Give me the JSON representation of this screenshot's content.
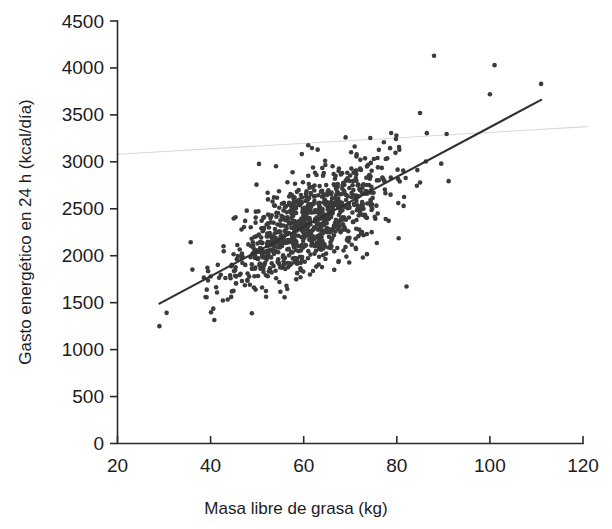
{
  "chart_data": {
    "type": "scatter",
    "title": "",
    "xlabel": "Masa libre de grasa (kg)",
    "ylabel": "Gasto energético en 24 h (kcal/día)",
    "xlim": [
      20,
      120
    ],
    "ylim": [
      0,
      4500
    ],
    "xticks": [
      20,
      40,
      60,
      80,
      100,
      120
    ],
    "yticks": [
      0,
      500,
      1000,
      1500,
      2000,
      2500,
      3000,
      3500,
      4000,
      4500
    ],
    "xtick_labels": [
      "20",
      "40",
      "60",
      "80",
      "100",
      "120"
    ],
    "ytick_labels": [
      "0",
      "500",
      "1000",
      "1500",
      "2000",
      "2500",
      "3000",
      "3500",
      "4000",
      "4500"
    ],
    "grid": false,
    "legend": null,
    "legend_position": "none",
    "point_color": "#3b3b3b",
    "point_size_px": 4.6,
    "n_points": 940,
    "series": [
      {
        "name": "Sujetos",
        "marker": "filled-circle",
        "color": "#3b3b3b",
        "description": "Relación positiva entre masa libre de grasa y gasto energético en 24 h",
        "x_range": [
          28,
          112
        ],
        "y_range": [
          1230,
          4130
        ]
      }
    ],
    "trendline": {
      "type": "linear-regression",
      "color": "#303030",
      "x_start": 29,
      "y_start": 1490,
      "x_end": 111,
      "y_end": 3660
    },
    "annotations": [
      {
        "type": "scan-artifact",
        "description": "línea horizontal tenue de escaneo",
        "color": "#d8d8d8",
        "x_start": 20,
        "y_start": 3080,
        "x_end": 121,
        "y_end": 3375
      }
    ],
    "notable_outliers": [
      {
        "x": 88,
        "y": 4130
      },
      {
        "x": 101,
        "y": 4030
      },
      {
        "x": 111,
        "y": 3830
      },
      {
        "x": 100,
        "y": 3720
      },
      {
        "x": 85,
        "y": 3520
      },
      {
        "x": 69,
        "y": 3260
      },
      {
        "x": 63,
        "y": 3130
      },
      {
        "x": 62,
        "y": 2940
      },
      {
        "x": 85,
        "y": 2780
      },
      {
        "x": 29,
        "y": 1250
      }
    ]
  },
  "axes": {
    "x_axis_name": "x-axis",
    "y_axis_name": "y-axis"
  }
}
